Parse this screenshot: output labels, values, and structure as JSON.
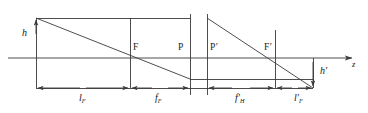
{
  "figure": {
    "type": "optical-ray-diagram",
    "background_color": "#ffffff",
    "line_color": "#3a3a3a",
    "text_color": "#1a1a1a"
  },
  "labels": {
    "object_height": "h",
    "image_height": "h",
    "image_height_prime": "′",
    "front_focal_point": "F",
    "front_principal_plane": "P",
    "rear_principal_plane": "P",
    "rear_principal_plane_prime": "′",
    "rear_focal_point": "F",
    "rear_focal_point_prime": "′",
    "axis": "z"
  },
  "dimensions": [
    {
      "name": "front-focal-distance",
      "symbol": "l",
      "subscript": "F",
      "prime": "",
      "x_start": 36,
      "x_end": 130
    },
    {
      "name": "front-focal-length",
      "symbol": "f",
      "subscript": "F",
      "prime": "",
      "x_start": 130,
      "x_end": 190
    },
    {
      "name": "rear-focal-length",
      "symbol": "f",
      "subscript": "H",
      "prime": "′",
      "x_start": 207,
      "x_end": 275
    },
    {
      "name": "rear-focal-distance",
      "symbol": "l",
      "subscript": "F",
      "prime": "′",
      "x_start": 275,
      "x_end": 313
    }
  ],
  "geometry": {
    "axis_y": 58,
    "dimension_line_y": 88,
    "object_top_y": 18,
    "image_bottom_y": 88,
    "vertical_lines_x": [
      36,
      130,
      190,
      207,
      275
    ],
    "ray_upper_horizontal_y": 18,
    "ray_lower_horizontal_y": 79,
    "axis_arrow_x": 358
  }
}
